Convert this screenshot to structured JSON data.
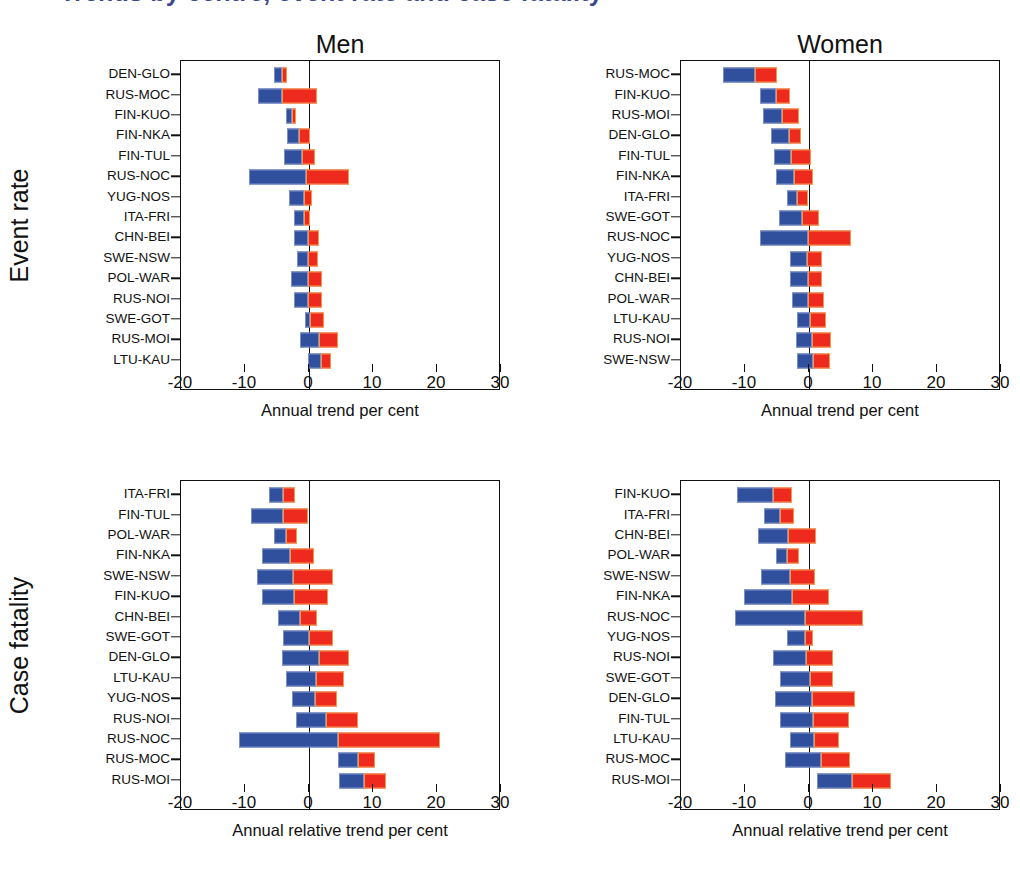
{
  "figure": {
    "title_remnant": "Trends by centre, event rate and case fatality",
    "row_captions": {
      "event_rate": "Event rate",
      "case_fatality": "Case fatality"
    },
    "column_titles": {
      "men": "Men",
      "women": "Women"
    },
    "colors": {
      "blue": "#30509e",
      "red": "#ee2a1e",
      "axis": "#111111",
      "background": "#ffffff"
    }
  },
  "chart_data": [
    {
      "id": "men-event-rate",
      "type": "bar",
      "orientation": "horizontal",
      "stacked": true,
      "title": "Men",
      "row_group": "Event rate",
      "xlabel": "Annual trend per cent",
      "ylabel": "",
      "xlim": [
        -20,
        30
      ],
      "xticks": [
        -20,
        -10,
        0,
        10,
        20,
        30
      ],
      "xticklabels": [
        "-20",
        "-10",
        "0",
        "10",
        "20",
        "30"
      ],
      "grid": false,
      "legend": "none",
      "series": [
        {
          "name": "negative-trend",
          "color": "#30509e"
        },
        {
          "name": "positive-trend",
          "color": "#ee2a1e"
        }
      ],
      "categories": [
        "DEN-GLO",
        "RUS-MOC",
        "FIN-KUO",
        "FIN-NKA",
        "FIN-TUL",
        "RUS-NOC",
        "YUG-NOS",
        "ITA-FRI",
        "CHN-BEI",
        "SWE-NSW",
        "POL-WAR",
        "RUS-NOI",
        "SWE-GOT",
        "RUS-MOI",
        "LTU-KAU"
      ],
      "bars": [
        {
          "category": "DEN-GLO",
          "blue_from": -5.5,
          "blue_to": -4.2,
          "red_from": -4.2,
          "red_to": -3.5
        },
        {
          "category": "RUS-MOC",
          "blue_from": -8.0,
          "blue_to": -4.2,
          "red_from": -4.2,
          "red_to": 1.3
        },
        {
          "category": "FIN-KUO",
          "blue_from": -3.6,
          "blue_to": -2.6,
          "red_from": -2.6,
          "red_to": -2.0
        },
        {
          "category": "FIN-NKA",
          "blue_from": -3.4,
          "blue_to": -1.5,
          "red_from": -1.5,
          "red_to": 0.2
        },
        {
          "category": "FIN-TUL",
          "blue_from": -3.9,
          "blue_to": -1.1,
          "red_from": -1.1,
          "red_to": 0.9
        },
        {
          "category": "RUS-NOC",
          "blue_from": -9.4,
          "blue_to": -0.4,
          "red_from": -0.4,
          "red_to": 6.3
        },
        {
          "category": "YUG-NOS",
          "blue_from": -3.1,
          "blue_to": -0.8,
          "red_from": -0.8,
          "red_to": 0.4
        },
        {
          "category": "ITA-FRI",
          "blue_from": -2.3,
          "blue_to": -0.8,
          "red_from": -0.8,
          "red_to": 0.1
        },
        {
          "category": "CHN-BEI",
          "blue_from": -2.3,
          "blue_to": -0.2,
          "red_from": -0.2,
          "red_to": 1.5
        },
        {
          "category": "SWE-NSW",
          "blue_from": -1.9,
          "blue_to": -0.2,
          "red_from": -0.2,
          "red_to": 1.4
        },
        {
          "category": "POL-WAR",
          "blue_from": -2.8,
          "blue_to": -0.1,
          "red_from": -0.1,
          "red_to": 2.1
        },
        {
          "category": "RUS-NOI",
          "blue_from": -2.3,
          "blue_to": -0.1,
          "red_from": -0.1,
          "red_to": 2.0
        },
        {
          "category": "SWE-GOT",
          "blue_from": -0.6,
          "blue_to": 0.1,
          "red_from": 0.1,
          "red_to": 2.3
        },
        {
          "category": "RUS-MOI",
          "blue_from": -1.4,
          "blue_to": 1.5,
          "red_from": 1.5,
          "red_to": 4.6
        },
        {
          "category": "LTU-KAU",
          "blue_from": -0.2,
          "blue_to": 1.8,
          "red_from": 1.8,
          "red_to": 3.5
        }
      ]
    },
    {
      "id": "women-event-rate",
      "type": "bar",
      "orientation": "horizontal",
      "stacked": true,
      "title": "Women",
      "row_group": "Event rate",
      "xlabel": "Annual  trend per cent",
      "ylabel": "",
      "xlim": [
        -20,
        30
      ],
      "xticks": [
        -20,
        -10,
        0,
        10,
        20,
        30
      ],
      "xticklabels": [
        "-20",
        "-10",
        "0",
        "10",
        "20",
        "30"
      ],
      "grid": false,
      "legend": "none",
      "series": [
        {
          "name": "negative-trend",
          "color": "#30509e"
        },
        {
          "name": "positive-trend",
          "color": "#ee2a1e"
        }
      ],
      "categories": [
        "RUS-MOC",
        "FIN-KUO",
        "RUS-MOI",
        "DEN-GLO",
        "FIN-TUL",
        "FIN-NKA",
        "ITA-FRI",
        "SWE-GOT",
        "RUS-NOC",
        "YUG-NOS",
        "CHN-BEI",
        "POL-WAR",
        "LTU-KAU",
        "RUS-NOI",
        "SWE-NSW"
      ],
      "bars": [
        {
          "category": "RUS-MOC",
          "blue_from": -13.4,
          "blue_to": -8.4,
          "red_from": -8.4,
          "red_to": -5.0
        },
        {
          "category": "FIN-KUO",
          "blue_from": -7.6,
          "blue_to": -5.2,
          "red_from": -5.2,
          "red_to": -2.9
        },
        {
          "category": "RUS-MOI",
          "blue_from": -7.2,
          "blue_to": -4.2,
          "red_from": -4.2,
          "red_to": -1.5
        },
        {
          "category": "DEN-GLO",
          "blue_from": -6.0,
          "blue_to": -3.1,
          "red_from": -3.1,
          "red_to": -1.2
        },
        {
          "category": "FIN-TUL",
          "blue_from": -5.5,
          "blue_to": -2.8,
          "red_from": -2.8,
          "red_to": 0.3
        },
        {
          "category": "FIN-NKA",
          "blue_from": -5.1,
          "blue_to": -2.4,
          "red_from": -2.4,
          "red_to": 0.6
        },
        {
          "category": "ITA-FRI",
          "blue_from": -3.4,
          "blue_to": -1.9,
          "red_from": -1.9,
          "red_to": -0.2
        },
        {
          "category": "SWE-GOT",
          "blue_from": -4.7,
          "blue_to": -1.1,
          "red_from": -1.1,
          "red_to": 1.6
        },
        {
          "category": "RUS-NOC",
          "blue_from": -7.7,
          "blue_to": -0.2,
          "red_from": -0.2,
          "red_to": 6.6
        },
        {
          "category": "YUG-NOS",
          "blue_from": -3.0,
          "blue_to": -0.3,
          "red_from": -0.3,
          "red_to": 2.1
        },
        {
          "category": "CHN-BEI",
          "blue_from": -3.0,
          "blue_to": -0.2,
          "red_from": -0.2,
          "red_to": 2.1
        },
        {
          "category": "POL-WAR",
          "blue_from": -2.6,
          "blue_to": -0.2,
          "red_from": -0.2,
          "red_to": 2.3
        },
        {
          "category": "LTU-KAU",
          "blue_from": -1.9,
          "blue_to": 0.2,
          "red_from": 0.2,
          "red_to": 2.7
        },
        {
          "category": "RUS-NOI",
          "blue_from": -2.1,
          "blue_to": 0.5,
          "red_from": 0.5,
          "red_to": 3.4
        },
        {
          "category": "SWE-NSW",
          "blue_from": -1.8,
          "blue_to": 0.6,
          "red_from": 0.6,
          "red_to": 3.3
        }
      ]
    },
    {
      "id": "men-case-fatality",
      "type": "bar",
      "orientation": "horizontal",
      "stacked": true,
      "title": "Men",
      "row_group": "Case fatality",
      "xlabel": "Annual relative trend per cent",
      "ylabel": "",
      "xlim": [
        -20,
        30
      ],
      "xticks": [
        -20,
        -10,
        0,
        10,
        20,
        30
      ],
      "xticklabels": [
        "-20",
        "-10",
        "0",
        "10",
        "20",
        "30"
      ],
      "grid": false,
      "legend": "none",
      "series": [
        {
          "name": "negative-trend",
          "color": "#30509e"
        },
        {
          "name": "positive-trend",
          "color": "#ee2a1e"
        }
      ],
      "categories": [
        "ITA-FRI",
        "FIN-TUL",
        "POL-WAR",
        "FIN-NKA",
        "SWE-NSW",
        "FIN-KUO",
        "CHN-BEI",
        "SWE-GOT",
        "DEN-GLO",
        "LTU-KAU",
        "YUG-NOS",
        "RUS-NOI",
        "RUS-NOC",
        "RUS-MOC",
        "RUS-MOI"
      ],
      "bars": [
        {
          "category": "ITA-FRI",
          "blue_from": -6.3,
          "blue_to": -4.1,
          "red_from": -4.1,
          "red_to": -2.2
        },
        {
          "category": "FIN-TUL",
          "blue_from": -9.0,
          "blue_to": -4.0,
          "red_from": -4.0,
          "red_to": -0.2
        },
        {
          "category": "POL-WAR",
          "blue_from": -5.4,
          "blue_to": -3.6,
          "red_from": -3.6,
          "red_to": -1.8
        },
        {
          "category": "FIN-NKA",
          "blue_from": -7.4,
          "blue_to": -2.9,
          "red_from": -2.9,
          "red_to": 0.8
        },
        {
          "category": "SWE-NSW",
          "blue_from": -8.2,
          "blue_to": -2.5,
          "red_from": -2.5,
          "red_to": 3.8
        },
        {
          "category": "FIN-KUO",
          "blue_from": -7.4,
          "blue_to": -2.4,
          "red_from": -2.4,
          "red_to": 2.9
        },
        {
          "category": "CHN-BEI",
          "blue_from": -4.8,
          "blue_to": -1.4,
          "red_from": -1.4,
          "red_to": 1.3
        },
        {
          "category": "SWE-GOT",
          "blue_from": -4.1,
          "blue_to": 0.0,
          "red_from": 0.0,
          "red_to": 3.8
        },
        {
          "category": "DEN-GLO",
          "blue_from": -4.2,
          "blue_to": 1.5,
          "red_from": 1.5,
          "red_to": 6.2
        },
        {
          "category": "LTU-KAU",
          "blue_from": -3.6,
          "blue_to": 1.1,
          "red_from": 1.1,
          "red_to": 5.4
        },
        {
          "category": "YUG-NOS",
          "blue_from": -2.6,
          "blue_to": 0.9,
          "red_from": 0.9,
          "red_to": 4.4
        },
        {
          "category": "RUS-NOI",
          "blue_from": -2.1,
          "blue_to": 2.6,
          "red_from": 2.6,
          "red_to": 7.7
        },
        {
          "category": "RUS-NOC",
          "blue_from": -11.0,
          "blue_to": 4.5,
          "red_from": 4.5,
          "red_to": 20.5
        },
        {
          "category": "RUS-MOC",
          "blue_from": 4.5,
          "blue_to": 7.6,
          "red_from": 7.6,
          "red_to": 10.3
        },
        {
          "category": "RUS-MOI",
          "blue_from": 4.7,
          "blue_to": 8.6,
          "red_from": 8.6,
          "red_to": 12.0
        }
      ]
    },
    {
      "id": "women-case-fatality",
      "type": "bar",
      "orientation": "horizontal",
      "stacked": true,
      "title": "Women",
      "row_group": "Case fatality",
      "xlabel": "Annual relative trend per cent",
      "ylabel": "",
      "xlim": [
        -20,
        30
      ],
      "xticks": [
        -20,
        -10,
        0,
        10,
        20,
        30
      ],
      "xticklabels": [
        "-20",
        "-10",
        "0",
        "10",
        "20",
        "30"
      ],
      "grid": false,
      "legend": "none",
      "series": [
        {
          "name": "negative-trend",
          "color": "#30509e"
        },
        {
          "name": "positive-trend",
          "color": "#ee2a1e"
        }
      ],
      "categories": [
        "FIN-KUO",
        "ITA-FRI",
        "CHN-BEI",
        "POL-WAR",
        "SWE-NSW",
        "FIN-NKA",
        "RUS-NOC",
        "YUG-NOS",
        "RUS-NOI",
        "SWE-GOT",
        "DEN-GLO",
        "FIN-TUL",
        "LTU-KAU",
        "RUS-MOC",
        "RUS-MOI"
      ],
      "bars": [
        {
          "category": "FIN-KUO",
          "blue_from": -11.2,
          "blue_to": -5.6,
          "red_from": -5.6,
          "red_to": -2.6
        },
        {
          "category": "ITA-FRI",
          "blue_from": -7.0,
          "blue_to": -4.6,
          "red_from": -4.6,
          "red_to": -2.4
        },
        {
          "category": "CHN-BEI",
          "blue_from": -8.0,
          "blue_to": -3.3,
          "red_from": -3.3,
          "red_to": 1.1
        },
        {
          "category": "POL-WAR",
          "blue_from": -5.1,
          "blue_to": -3.4,
          "red_from": -3.4,
          "red_to": -1.6
        },
        {
          "category": "SWE-NSW",
          "blue_from": -7.5,
          "blue_to": -3.0,
          "red_from": -3.0,
          "red_to": 0.9
        },
        {
          "category": "FIN-NKA",
          "blue_from": -10.2,
          "blue_to": -2.7,
          "red_from": -2.7,
          "red_to": 3.1
        },
        {
          "category": "RUS-NOC",
          "blue_from": -11.5,
          "blue_to": -0.6,
          "red_from": -0.6,
          "red_to": 8.4
        },
        {
          "category": "YUG-NOS",
          "blue_from": -3.5,
          "blue_to": -0.6,
          "red_from": -0.6,
          "red_to": 0.6
        },
        {
          "category": "RUS-NOI",
          "blue_from": -5.6,
          "blue_to": -0.4,
          "red_from": -0.4,
          "red_to": 3.8
        },
        {
          "category": "SWE-GOT",
          "blue_from": -4.6,
          "blue_to": 0.1,
          "red_from": 0.1,
          "red_to": 3.8
        },
        {
          "category": "DEN-GLO",
          "blue_from": -5.3,
          "blue_to": 0.5,
          "red_from": 0.5,
          "red_to": 7.2
        },
        {
          "category": "FIN-TUL",
          "blue_from": -4.6,
          "blue_to": 0.6,
          "red_from": 0.6,
          "red_to": 6.3
        },
        {
          "category": "LTU-KAU",
          "blue_from": -2.9,
          "blue_to": 0.8,
          "red_from": 0.8,
          "red_to": 4.7
        },
        {
          "category": "RUS-MOC",
          "blue_from": -3.7,
          "blue_to": 1.9,
          "red_from": 1.9,
          "red_to": 6.4
        },
        {
          "category": "RUS-MOI",
          "blue_from": 1.3,
          "blue_to": 6.7,
          "red_from": 6.7,
          "red_to": 12.8
        }
      ]
    }
  ]
}
